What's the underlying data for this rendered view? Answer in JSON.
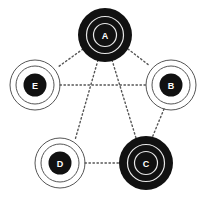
{
  "diagram": {
    "type": "network-graph",
    "colors": {
      "background": "#ffffff",
      "node_fill": "#111111",
      "ring_stroke": "#555555",
      "inner_ring": "#e8e8e8",
      "edge": "#555555",
      "label": "#ffffff"
    },
    "nodes": [
      {
        "id": "A",
        "label": "A",
        "style": "filled",
        "cx": 105,
        "cy": 35
      },
      {
        "id": "B",
        "label": "B",
        "style": "outlined",
        "cx": 171,
        "cy": 85
      },
      {
        "id": "C",
        "label": "C",
        "style": "filled",
        "cx": 146,
        "cy": 163
      },
      {
        "id": "D",
        "label": "D",
        "style": "outlined",
        "cx": 60,
        "cy": 163
      },
      {
        "id": "E",
        "label": "E",
        "style": "outlined",
        "cx": 35,
        "cy": 85
      }
    ],
    "edges": [
      {
        "from": "A",
        "to": "E",
        "style": "dotted"
      },
      {
        "from": "A",
        "to": "B",
        "style": "dotted"
      },
      {
        "from": "E",
        "to": "B",
        "style": "dotted"
      },
      {
        "from": "A",
        "to": "D",
        "style": "dotted"
      },
      {
        "from": "A",
        "to": "C",
        "style": "dotted"
      },
      {
        "from": "B",
        "to": "C",
        "style": "dotted"
      },
      {
        "from": "D",
        "to": "C",
        "style": "dotted"
      }
    ]
  }
}
